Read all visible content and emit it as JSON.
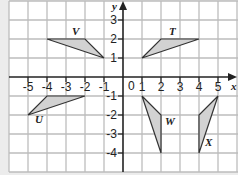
{
  "diagram": {
    "type": "coordinate-grid",
    "axes": {
      "x_label": "x",
      "y_label": "y",
      "x_ticks": [
        "-5",
        "-4",
        "-3",
        "-2",
        "-1",
        "1",
        "2",
        "3",
        "4",
        "5"
      ],
      "y_ticks": [
        "3",
        "2",
        "1",
        "-1",
        "-2",
        "-3",
        "-4"
      ],
      "origin_label": "0"
    },
    "shapes": [
      {
        "label": "T",
        "vertices": [
          [
            1,
            1
          ],
          [
            2,
            2
          ],
          [
            4,
            2
          ]
        ]
      },
      {
        "label": "V",
        "vertices": [
          [
            -1,
            1
          ],
          [
            -2,
            2
          ],
          [
            -4,
            2
          ]
        ]
      },
      {
        "label": "U",
        "vertices": [
          [
            -5,
            -2
          ],
          [
            -4,
            -1
          ],
          [
            -2,
            -1
          ]
        ]
      },
      {
        "label": "W",
        "vertices": [
          [
            1,
            -1
          ],
          [
            2,
            -2
          ],
          [
            2,
            -4
          ]
        ]
      },
      {
        "label": "X",
        "vertices": [
          [
            5,
            -1
          ],
          [
            4,
            -2
          ],
          [
            4,
            -4
          ]
        ]
      }
    ],
    "colors": {
      "background": "#ffffff",
      "grid": "#bbbbbb",
      "axis": "#222222",
      "fill": "#d0d0d0"
    }
  }
}
